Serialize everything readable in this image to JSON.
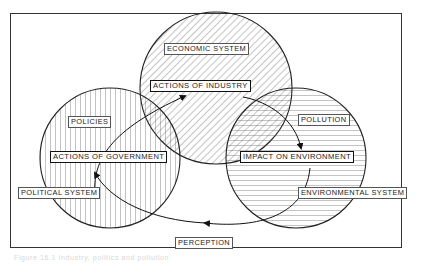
{
  "diagram": {
    "systems": [
      {
        "id": "economic",
        "label": "ECONOMIC SYSTEM",
        "hatch": "diagonal"
      },
      {
        "id": "political",
        "label": "POLITICAL SYSTEM",
        "hatch": "vertical"
      },
      {
        "id": "environmental",
        "label": "ENVIRONMENTAL SYSTEM",
        "hatch": "horizontal"
      }
    ],
    "actions": {
      "industry": "ACTIONS OF INDUSTRY",
      "government": "ACTIONS OF GOVERNMENT",
      "environment": "IMPACT ON ENVIRONMENT"
    },
    "flows": {
      "policies": "POLICIES",
      "pollution": "POLLUTION",
      "perception": "PERCEPTION"
    },
    "edges": [
      {
        "from": "ACTIONS OF GOVERNMENT",
        "to": "ACTIONS OF INDUSTRY",
        "via": "POLICIES"
      },
      {
        "from": "ACTIONS OF INDUSTRY",
        "to": "IMPACT ON ENVIRONMENT",
        "via": "POLLUTION"
      },
      {
        "from": "IMPACT ON ENVIRONMENT",
        "to": "ACTIONS OF GOVERNMENT",
        "via": "PERCEPTION"
      }
    ],
    "caption": "Figure 16.1 Industry, politics and pollution"
  },
  "colors": {
    "line": "#222222",
    "hatch": "#555555",
    "background": "#ffffff"
  }
}
